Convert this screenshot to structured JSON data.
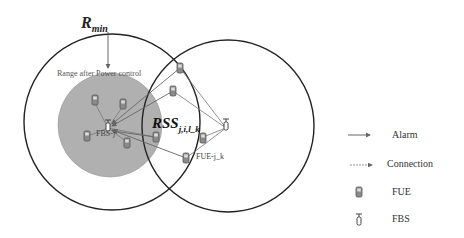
{
  "diagram": {
    "labels": {
      "r_min": "R",
      "r_min_sub": "min",
      "range_after_power_control": "Range after Power control",
      "rss": "RSS",
      "rss_sub": "j,i,l_k",
      "fbs_j": "FBS-j",
      "fue_j_k": "FUE-j_k"
    },
    "legend": [
      {
        "icon": "arrow-solid-icon",
        "label": "Alarm"
      },
      {
        "icon": "arrow-dashed-icon",
        "label": "Connection"
      },
      {
        "icon": "fue-phone-icon",
        "label": "FUE"
      },
      {
        "icon": "fbs-antenna-icon",
        "label": "FBS"
      }
    ],
    "colors": {
      "circle_stroke": "#222222",
      "coverage_fill": "#b0b0b0",
      "link_stroke": "#777777",
      "text": "#222222"
    }
  }
}
